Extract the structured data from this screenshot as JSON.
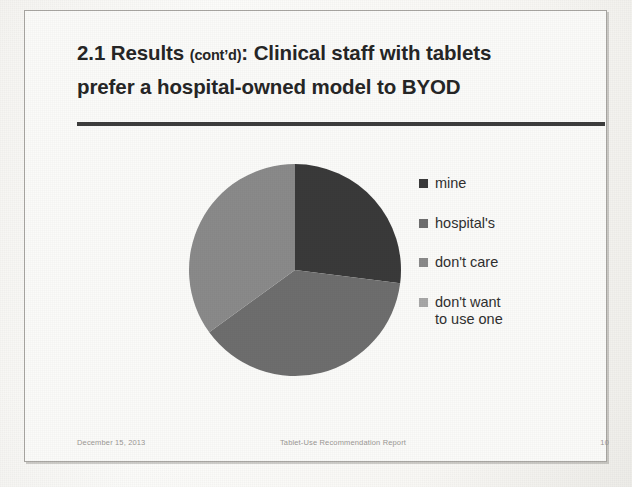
{
  "slide": {
    "title_line1_prefix": "2.1 Results ",
    "title_line1_contd": "(cont’d)",
    "title_line1_suffix": ": Clinical staff with tablets",
    "title_line2": "prefer a hospital-owned model to BYOD",
    "rule_color": "#3d3d3d",
    "background_color": "#fbfbf9",
    "border_color": "#a9a7a3"
  },
  "footer": {
    "date": "December 15, 2013",
    "document_title": "Tablet-Use Recommendation Report",
    "page_number": "10"
  },
  "legend": {
    "items": [
      {
        "label": "mine",
        "color": "#3a3a3a"
      },
      {
        "label": "hospital's",
        "color": "#6e6e6e"
      },
      {
        "label": "don't care",
        "color": "#8a8a8a"
      },
      {
        "label": "don't want\nto use one",
        "color": "#a8a8a8"
      }
    ]
  },
  "chart_data": {
    "type": "pie",
    "categories": [
      "mine",
      "hospital's",
      "don't care",
      "don't want to use one"
    ],
    "values": [
      27,
      38,
      35,
      0
    ],
    "unit": "percent",
    "colors": [
      "#3a3a3a",
      "#6e6e6e",
      "#8a8a8a",
      "#a8a8a8"
    ],
    "start_angle_deg": 0,
    "direction": "clockwise",
    "legend_position": "right",
    "data_labels": false,
    "grid": false,
    "center_x": 107,
    "center_y": 107,
    "radius": 106
  }
}
